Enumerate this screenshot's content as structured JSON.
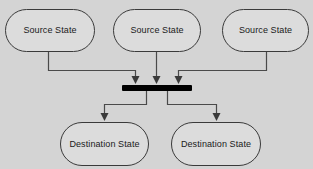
{
  "diagram": {
    "type": "uml-state-diagram",
    "canvas": {
      "width": 313,
      "height": 169
    },
    "colors": {
      "background": "#d4d4d4",
      "node_fill": "#dcdcdc",
      "node_border": "#3a3a3a",
      "bar_fill": "#000000",
      "edge_stroke": "#4a4a4a",
      "text": "#1a1a1a"
    },
    "source_states": [
      {
        "id": "source-state-1",
        "label": "Source State",
        "x": 5,
        "y": 9,
        "width": 90,
        "height": 43
      },
      {
        "id": "source-state-2",
        "label": "Source State",
        "x": 113,
        "y": 9,
        "width": 88,
        "height": 43
      },
      {
        "id": "source-state-3",
        "label": "Source State",
        "x": 222,
        "y": 9,
        "width": 87,
        "height": 43
      }
    ],
    "destination_states": [
      {
        "id": "destination-state-1",
        "label": "Destination State",
        "x": 60,
        "y": 122,
        "width": 89,
        "height": 44
      },
      {
        "id": "destination-state-2",
        "label": "Destination State",
        "x": 171,
        "y": 122,
        "width": 90,
        "height": 44
      }
    ],
    "sync_bar": {
      "id": "synchronization-bar",
      "x": 122,
      "y": 85,
      "width": 70,
      "height": 6
    },
    "incoming_edges": [
      {
        "id": "edge-source1-to-bar",
        "from": "source-state-1",
        "to": "synchronization-bar",
        "path": "M 48.5 52 L 48.5 70.5 L 135.5 70.5 L 135.5 80",
        "arrow_x": 135.5,
        "arrow_y": 85
      },
      {
        "id": "edge-source2-to-bar",
        "from": "source-state-2",
        "to": "synchronization-bar",
        "path": "M 156.5 52 L 156.5 80",
        "arrow_x": 156.5,
        "arrow_y": 85
      },
      {
        "id": "edge-source3-to-bar",
        "from": "source-state-3",
        "to": "synchronization-bar",
        "path": "M 266.5 52 L 266.5 70.5 L 178.5 70.5 L 178.5 80",
        "arrow_x": 178.5,
        "arrow_y": 85
      }
    ],
    "outgoing_edges": [
      {
        "id": "edge-bar-to-destination1",
        "from": "synchronization-bar",
        "to": "destination-state-1",
        "path": "M 146.5 91 L 146.5 104.5 L 104.5 104.5 L 104.5 117",
        "arrow_x": 104.5,
        "arrow_y": 122
      },
      {
        "id": "edge-bar-to-destination2",
        "from": "synchronization-bar",
        "to": "destination-state-2",
        "path": "M 167.5 91 L 167.5 104.5 L 216.5 104.5 L 216.5 117",
        "arrow_x": 216.5,
        "arrow_y": 122
      }
    ]
  }
}
